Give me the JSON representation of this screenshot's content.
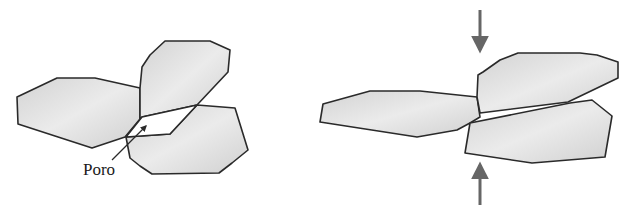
{
  "figure": {
    "left_panel": {
      "description": "Three grains with open pore between them",
      "grains": [
        {
          "name": "left-grain",
          "points": "17,97 18,124 92,148 125,137 140,119 140,88 95,78 57,78"
        },
        {
          "name": "top-grain",
          "points": "140,88 142,67 150,55 165,41 210,41 230,50 228,72 197,105 142,117 140,119"
        },
        {
          "name": "bottom-grain",
          "points": "197,105 235,108 248,150 232,163 219,173 152,174 140,166 130,158 126,137 170,134"
        }
      ],
      "pore_points": "142,117 197,105 170,134 126,137",
      "label": "Poro",
      "pointer": {
        "x1": 112,
        "y1": 160,
        "x2": 146,
        "y2": 126
      }
    },
    "right_panel": {
      "description": "Compacted grains, pore closed under pressure",
      "grains": [
        {
          "name": "left-flat-grain",
          "points": "320,122 323,104 370,91 420,91 477,97 480,117 470,123 457,130 417,137"
        },
        {
          "name": "top-right-grain",
          "points": "477,97 478,75 483,72 500,60 518,53 580,53 597,55 618,62 618,78 568,102 480,113"
        },
        {
          "name": "bottom-right-grain",
          "points": "470,123 570,103 592,100 612,116 605,157 532,163 465,153"
        }
      ],
      "arrows": [
        {
          "name": "compression-arrow-top",
          "x": 480,
          "y1": 10,
          "y2": 50,
          "direction": "down"
        },
        {
          "name": "compression-arrow-bottom",
          "x": 480,
          "y1": 205,
          "y2": 165,
          "direction": "up"
        }
      ]
    },
    "colors": {
      "grain_fill_light": "#ececec",
      "grain_fill_dark": "#cfcfcf",
      "outline": "#2a2a2a",
      "arrow": "#666666"
    }
  }
}
